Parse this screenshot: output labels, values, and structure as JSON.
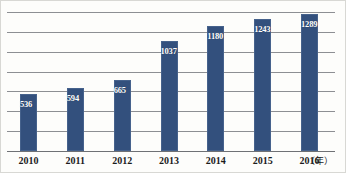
{
  "chart_data": {
    "type": "bar",
    "title": "",
    "xlabel": "（年）",
    "ylabel": "",
    "categories": [
      "2010",
      "2011",
      "2012",
      "2013",
      "2014",
      "2015",
      "2016"
    ],
    "values": [
      536,
      594,
      665,
      1037,
      1180,
      1243,
      1289
    ],
    "value_labels": [
      "536",
      "594",
      "665",
      "1037",
      "1180",
      "1243",
      "1289"
    ],
    "ylim": [
      0,
      1400
    ],
    "grid": true,
    "gridline_count": 7,
    "legend": "none",
    "series": [
      {
        "name": "",
        "values": [
          536,
          594,
          665,
          1037,
          1180,
          1243,
          1289
        ]
      }
    ],
    "colors": {
      "bar": "#33507d",
      "bar_edge": "#46628c",
      "gridline": "#8d8f93",
      "axis": "#6f7175",
      "value_label": "#ffffff",
      "tick_label": "#1b1b1b",
      "background": "#fdfdfb"
    }
  }
}
